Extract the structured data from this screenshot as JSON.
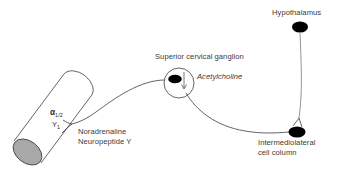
{
  "figure": {
    "background_color": "#ffffff",
    "line_color": "#3c3c3c",
    "node_color": "#000000",
    "vessel_cap_color": "#a8a8a8",
    "text_color": "#3a3a3a"
  },
  "nodes": [
    {
      "id": "hypothalamus",
      "label": "Hypothalamus",
      "shape": "filled-ellipse",
      "color": "#000000",
      "cx": 300,
      "cy": 27,
      "rx": 8,
      "ry": 5.5
    },
    {
      "id": "intermediolateral-cell-column",
      "label_line1": "Intermediolateral",
      "label_line2": "cell column",
      "shape": "filled-ellipse",
      "color": "#000000",
      "cx": 297,
      "cy": 132,
      "rx": 8.5,
      "ry": 5.5
    },
    {
      "id": "superior-cervical-ganglion",
      "label": "Superior cervical ganglion",
      "shape": "circle-with-filled-ellipse",
      "circle_color": "#3c3c3c",
      "cell_color": "#000000",
      "cx": 179,
      "cy": 83,
      "r": 15,
      "cell_cx": 175,
      "cell_cy": 79,
      "cell_rx": 6.8,
      "cell_ry": 4.3
    },
    {
      "id": "blood-vessel",
      "shape": "cylinder",
      "cap_color": "#a8a8a8",
      "outline_color": "#3c3c3c"
    }
  ],
  "labels": {
    "hypothalamus": "Hypothalamus",
    "superior_cervical_ganglion": "Superior cervical ganglion",
    "acetylcholine": "Acetylcholine",
    "noradrenaline": "Noradrenaline",
    "neuropeptide_y": "Neuropeptide Y",
    "iml_line1": "Intermediolateral",
    "iml_line2": "cell column",
    "receptor_alpha": "α",
    "receptor_alpha_sub": "1/2",
    "receptor_y": "Y",
    "receptor_y_sub": "1"
  },
  "connections": [
    {
      "id": "hypothalamus-to-iml",
      "from": "hypothalamus",
      "to": "intermediolateral-cell-column",
      "style": "solid-curve"
    },
    {
      "id": "iml-to-ganglion",
      "from": "intermediolateral-cell-column",
      "to": "superior-cervical-ganglion",
      "style": "solid-curve",
      "transmitter": "Acetylcholine"
    },
    {
      "id": "ganglion-to-vessel",
      "from": "superior-cervical-ganglion",
      "to": "blood-vessel",
      "style": "solid-curve-branching",
      "transmitters": [
        "Noradrenaline",
        "Neuropeptide Y"
      ],
      "receptors": [
        "α1/2",
        "Y1"
      ]
    }
  ]
}
